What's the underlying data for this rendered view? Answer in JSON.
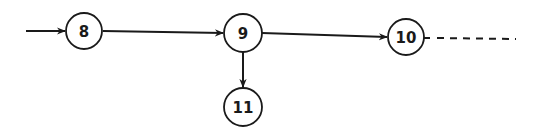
{
  "diagram": {
    "type": "flow-graph",
    "nodes": [
      {
        "id": "8",
        "label": "8",
        "cx": 84,
        "cy": 31,
        "r": 18
      },
      {
        "id": "9",
        "label": "9",
        "cx": 243,
        "cy": 33,
        "r": 19
      },
      {
        "id": "10",
        "label": "10",
        "cx": 406,
        "cy": 37,
        "r": 18
      },
      {
        "id": "11",
        "label": "11",
        "cx": 243,
        "cy": 107,
        "r": 19
      }
    ],
    "edges": [
      {
        "from": "entry",
        "to": "8",
        "style": "solid-arrow"
      },
      {
        "from": "8",
        "to": "9",
        "style": "solid-arrow"
      },
      {
        "from": "9",
        "to": "10",
        "style": "solid-arrow"
      },
      {
        "from": "9",
        "to": "11",
        "style": "solid-arrow"
      },
      {
        "from": "10",
        "to": "continuation",
        "style": "dashed"
      }
    ],
    "colors": {
      "stroke": "#1a1a1a",
      "background": "#ffffff"
    }
  }
}
